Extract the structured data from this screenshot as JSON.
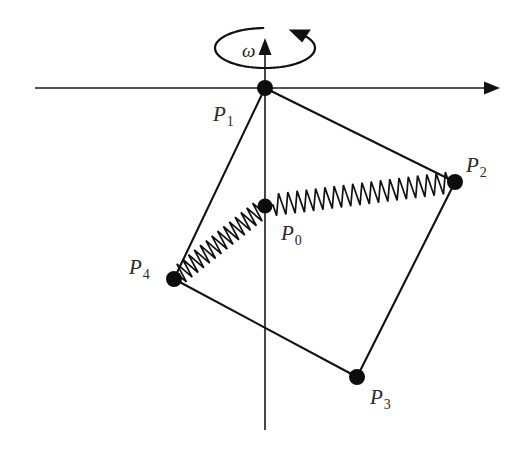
{
  "figure": {
    "background_color": "#ffffff",
    "line_color": "#111111",
    "label_color": "#2a2a2a",
    "width": 527,
    "height": 450
  },
  "axes": {
    "horizontal": {
      "name": "horizontal-axis",
      "x_start": 35,
      "x_end": 500,
      "y": 88,
      "arrow_at": "right"
    },
    "vertical": {
      "name": "vertical-axis",
      "x": 265,
      "y_start": 38,
      "y_end": 430,
      "arrow_at": "top"
    }
  },
  "rotation": {
    "symbol": "ω",
    "name": "angular-velocity",
    "ellipse_center_x": 265,
    "ellipse_center_y": 48,
    "ellipse_rx": 50,
    "ellipse_ry": 20,
    "arrow_direction": "counterclockwise-viewed-from-above",
    "label_x": 242,
    "label_y": 57
  },
  "points": [
    {
      "id": "P0",
      "letter": "P",
      "subscript": "0",
      "x": 265,
      "y": 206,
      "radius": 7.5,
      "label_x": 281,
      "label_y": 240
    },
    {
      "id": "P1",
      "letter": "P",
      "subscript": "1",
      "x": 265,
      "y": 88,
      "radius": 8,
      "label_x": 213,
      "label_y": 121
    },
    {
      "id": "P2",
      "letter": "P",
      "subscript": "2",
      "x": 455,
      "y": 182,
      "radius": 8,
      "label_x": 466,
      "label_y": 172
    },
    {
      "id": "P3",
      "letter": "P",
      "subscript": "3",
      "x": 357,
      "y": 377,
      "radius": 8,
      "label_x": 370,
      "label_y": 404
    },
    {
      "id": "P4",
      "letter": "P",
      "subscript": "4",
      "x": 174,
      "y": 279,
      "radius": 8,
      "label_x": 129,
      "label_y": 274
    }
  ],
  "edges": [
    {
      "name": "edge-p1-p2",
      "from": "P1",
      "to": "P2"
    },
    {
      "name": "edge-p2-p3",
      "from": "P2",
      "to": "P3"
    },
    {
      "name": "edge-p3-p4",
      "from": "P3",
      "to": "P4"
    },
    {
      "name": "edge-p4-p1",
      "from": "P4",
      "to": "P1"
    }
  ],
  "springs": [
    {
      "name": "spring-p0-p2",
      "from": "P0",
      "to": "P2",
      "coils": 19,
      "amplitude": 11,
      "lead_in": 8,
      "lead_out": 6
    },
    {
      "name": "spring-p0-p4",
      "from": "P0",
      "to": "P4",
      "coils": 14,
      "amplitude": 10,
      "lead_in": 6,
      "lead_out": 6
    }
  ]
}
